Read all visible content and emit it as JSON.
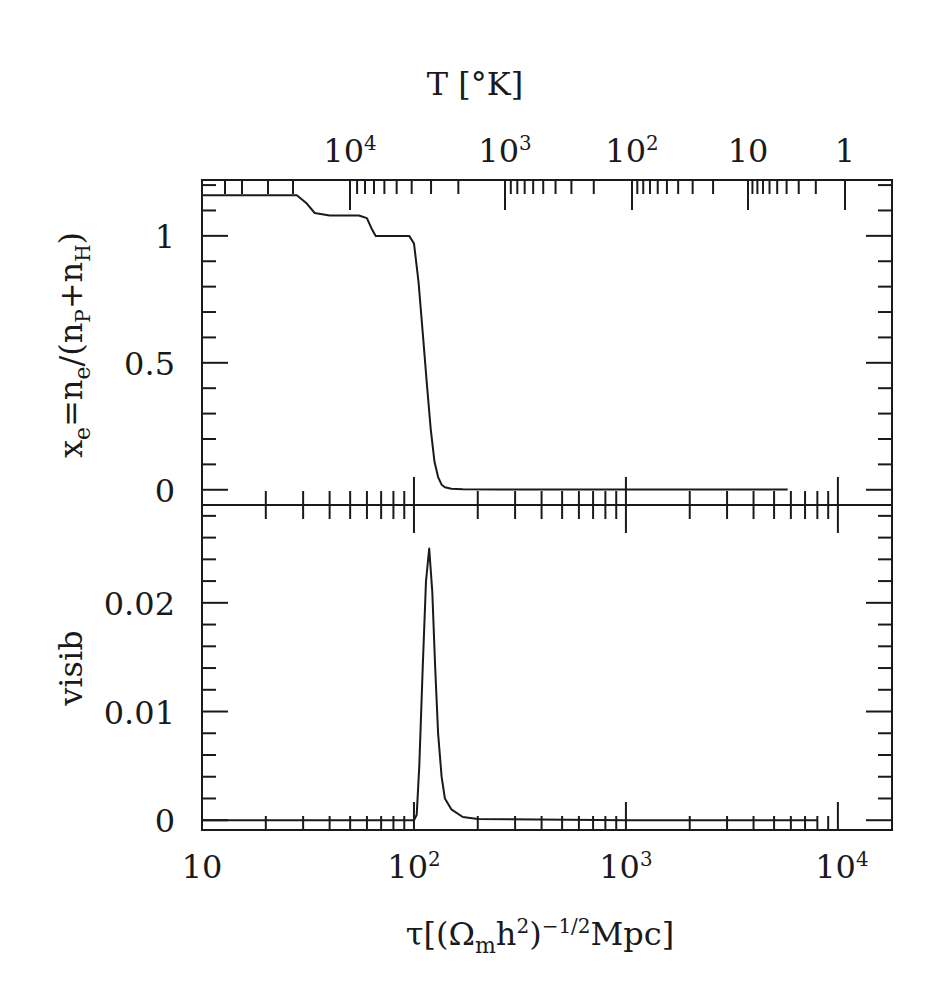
{
  "chart_data": [
    {
      "type": "line",
      "panel": "top",
      "title": "",
      "top_axis_label": "T [°K]",
      "top_axis_ticks": [
        {
          "label": "10",
          "sup": "4",
          "px": 350
        },
        {
          "label": "10",
          "sup": "3",
          "px": 505
        },
        {
          "label": "10",
          "sup": "2",
          "px": 632
        },
        {
          "label": "10",
          "sup": "",
          "px": 748
        },
        {
          "label": "1",
          "sup": "",
          "px": 845
        }
      ],
      "ylabel": "x_e = n_e/(n_P + n_H)",
      "ylim": [
        -0.06,
        1.22
      ],
      "yticks": [
        0,
        0.5,
        1
      ],
      "ytick_labels": [
        "0",
        "0.5",
        "1"
      ],
      "xscale": "log",
      "xlim": [
        10,
        18000
      ],
      "series": [
        {
          "name": "x_e",
          "x": [
            10,
            20,
            28,
            31,
            34,
            40,
            55,
            60,
            63,
            66,
            75,
            95,
            100,
            105,
            110,
            115,
            120,
            125,
            130,
            135,
            140,
            150,
            170,
            250,
            1000,
            3000,
            5800
          ],
          "y": [
            1.16,
            1.16,
            1.16,
            1.13,
            1.09,
            1.08,
            1.08,
            1.07,
            1.03,
            1.0,
            1.0,
            1.0,
            0.97,
            0.82,
            0.62,
            0.42,
            0.24,
            0.11,
            0.05,
            0.02,
            0.01,
            0.004,
            0.002,
            0.001,
            0.001,
            0.001,
            0.001
          ]
        }
      ]
    },
    {
      "type": "line",
      "panel": "bottom",
      "ylabel": "visib",
      "ylim": [
        -0.0009,
        0.029
      ],
      "yticks": [
        0,
        0.01,
        0.02
      ],
      "ytick_labels": [
        "0",
        "0.01",
        "0.02"
      ],
      "xlabel": "τ[(Ω_m h²)^(-1/2) Mpc]",
      "xscale": "log",
      "xlim": [
        10,
        18000
      ],
      "xticks": [
        10,
        100,
        1000,
        10000
      ],
      "xtick_labels": [
        {
          "label": "10",
          "sup": ""
        },
        {
          "label": "10",
          "sup": "2"
        },
        {
          "label": "10",
          "sup": "3"
        },
        {
          "label": "10",
          "sup": "4"
        }
      ],
      "series": [
        {
          "name": "visibility",
          "x": [
            10,
            100,
            103,
            106,
            110,
            114,
            118,
            122,
            126,
            130,
            135,
            140,
            150,
            170,
            200,
            1000,
            8000
          ],
          "y": [
            0,
            0,
            0.0005,
            0.005,
            0.014,
            0.022,
            0.025,
            0.021,
            0.014,
            0.008,
            0.004,
            0.002,
            0.001,
            0.0003,
            0.0001,
            0,
            0
          ]
        }
      ]
    }
  ],
  "labels": {
    "top_axis_title": "T [°K]",
    "y_top_title": "x_e = n_e/(n_P + n_H)",
    "y_bottom_title": "visib",
    "x_title": "τ[(Ωmh²)⁻¹ᐟ²Mpc]"
  }
}
